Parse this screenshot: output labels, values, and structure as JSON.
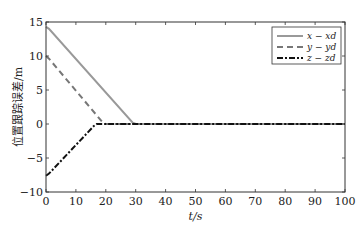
{
  "chart_data": {
    "type": "line",
    "title": "",
    "xlabel": "t/s",
    "ylabel": "位置跟踪误差/m",
    "xlim": [
      0,
      100
    ],
    "ylim": [
      -10,
      15
    ],
    "xticks": [
      0,
      10,
      20,
      30,
      40,
      50,
      60,
      70,
      80,
      90,
      100
    ],
    "yticks": [
      -10,
      -5,
      0,
      5,
      10,
      15
    ],
    "grid": false,
    "legend_position": "upper right",
    "series": [
      {
        "name": "x − x_d",
        "style": "solid",
        "color": "#999999",
        "x": [
          0,
          1,
          29,
          30,
          100
        ],
        "y": [
          14.3,
          14.0,
          0.2,
          0,
          0
        ]
      },
      {
        "name": "y − y_d",
        "style": "dashed",
        "color": "#777777",
        "x": [
          0,
          1,
          19,
          20,
          100
        ],
        "y": [
          10.0,
          9.6,
          0.2,
          0,
          0
        ]
      },
      {
        "name": "z − z_d",
        "style": "dashdot",
        "color": "#111111",
        "x": [
          0,
          1,
          16,
          17,
          100
        ],
        "y": [
          -7.6,
          -7.3,
          -0.3,
          0,
          0
        ]
      }
    ]
  }
}
